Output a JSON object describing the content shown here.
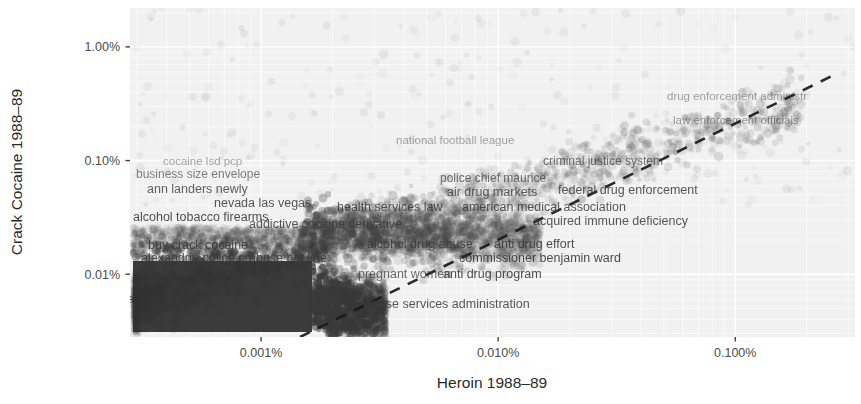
{
  "figure": {
    "background": "#ffffff",
    "panel_background": "#f1f1f1",
    "grid_color": "#fbfbfb",
    "point_color": "#4d4d4d",
    "label_color": "#3a3a3a",
    "refline_color": "#1a1a1a"
  },
  "chart_data": {
    "type": "scatter",
    "title": "",
    "xlabel": "Heroin 1988–89",
    "ylabel": "Crack Cocaine 1988–89",
    "xscale": "log",
    "yscale": "log",
    "xticks": [
      "0.001%",
      "0.010%",
      "0.100%"
    ],
    "xtick_values": [
      0.001,
      0.01,
      0.1
    ],
    "yticks": [
      "1.00%",
      "0.10%",
      "0.01%"
    ],
    "ytick_values": [
      1.0,
      0.1,
      0.01
    ],
    "xlim": [
      0.00028,
      0.32
    ],
    "ylim": [
      0.0028,
      2.2
    ],
    "grid": true,
    "legend": "none",
    "annotations": {
      "reference_line": {
        "style": "dashed",
        "description": "y = x diagonal reference line"
      }
    },
    "labeled_points": [
      {
        "text": "drug enforcement administr",
        "x": 0.055,
        "y": 0.32,
        "px": 667,
        "py": 100,
        "size": 11.5,
        "opacity": 0.45
      },
      {
        "text": "law enforcement officials",
        "x": 0.05,
        "y": 0.26,
        "px": 673,
        "py": 124,
        "size": 11.5,
        "opacity": 0.5
      },
      {
        "text": "national football league",
        "x": 0.0055,
        "y": 0.135,
        "px": 396,
        "py": 144,
        "size": 11.5,
        "opacity": 0.45
      },
      {
        "text": "criminal justice system",
        "x": 0.018,
        "y": 0.105,
        "px": 543,
        "py": 165,
        "size": 12,
        "opacity": 0.7
      },
      {
        "text": "cocaine lsd pcp",
        "x": 0.00072,
        "y": 0.075,
        "px": 163,
        "py": 165,
        "size": 11.5,
        "opacity": 0.45
      },
      {
        "text": "business size envelope",
        "x": 0.00062,
        "y": 0.062,
        "px": 136,
        "py": 178,
        "size": 12,
        "opacity": 0.65
      },
      {
        "text": "police chief maurice",
        "x": 0.0062,
        "y": 0.055,
        "px": 440,
        "py": 182,
        "size": 12,
        "opacity": 0.7
      },
      {
        "text": "federal drug enforcement",
        "x": 0.02,
        "y": 0.048,
        "px": 558,
        "py": 194,
        "size": 12.5,
        "opacity": 0.85
      },
      {
        "text": "ann landers newly",
        "x": 0.00068,
        "y": 0.048,
        "px": 147,
        "py": 193,
        "size": 12.5,
        "opacity": 0.8
      },
      {
        "text": "air drug markets",
        "x": 0.0068,
        "y": 0.046,
        "px": 447,
        "py": 196,
        "size": 12.5,
        "opacity": 0.8
      },
      {
        "text": "nevada las vegas",
        "x": 0.0012,
        "y": 0.038,
        "px": 214,
        "py": 207,
        "size": 12.5,
        "opacity": 0.85
      },
      {
        "text": "health services law",
        "x": 0.003,
        "y": 0.036,
        "px": 337,
        "py": 211,
        "size": 12.5,
        "opacity": 0.85
      },
      {
        "text": "american medical association",
        "x": 0.0105,
        "y": 0.035,
        "px": 462,
        "py": 211,
        "size": 12.5,
        "opacity": 0.85
      },
      {
        "text": "alcohol tobacco firearms",
        "x": 0.00058,
        "y": 0.03,
        "px": 133,
        "py": 221,
        "size": 12.5,
        "opacity": 0.9
      },
      {
        "text": "acquired immune deficiency",
        "x": 0.015,
        "y": 0.028,
        "px": 533,
        "py": 225,
        "size": 12.5,
        "opacity": 0.85
      },
      {
        "text": "addictive cocaine derivative",
        "x": 0.0017,
        "y": 0.024,
        "px": 249,
        "py": 228,
        "size": 12.5,
        "opacity": 0.85
      },
      {
        "text": "buy crack cocaine",
        "x": 0.0007,
        "y": 0.016,
        "px": 148,
        "py": 249,
        "size": 12.5,
        "opacity": 0.9
      },
      {
        "text": "alcohol drug abuse",
        "x": 0.004,
        "y": 0.015,
        "px": 367,
        "py": 248,
        "size": 12.5,
        "opacity": 0.85
      },
      {
        "text": "anti drug effort",
        "x": 0.0105,
        "y": 0.015,
        "px": 494,
        "py": 248,
        "size": 12.5,
        "opacity": 0.9
      },
      {
        "text": "alexandria police col",
        "x": 0.00062,
        "y": 0.0125,
        "px": 141,
        "py": 262,
        "size": 12.5,
        "opacity": 0.85
      },
      {
        "text": "abuse hot line",
        "x": 0.0014,
        "y": 0.0125,
        "px": 249,
        "py": 262,
        "size": 12.5,
        "opacity": 0.85
      },
      {
        "text": "commissioner benjamin ward",
        "x": 0.0098,
        "y": 0.012,
        "px": 459,
        "py": 262,
        "size": 12.5,
        "opacity": 0.9
      },
      {
        "text": "pregnant women",
        "x": 0.0048,
        "y": 0.0102,
        "px": 358,
        "py": 278,
        "size": 12.5,
        "opacity": 0.75
      },
      {
        "text": "anti drug program",
        "x": 0.009,
        "y": 0.0102,
        "px": 443,
        "py": 278,
        "size": 12.5,
        "opacity": 0.9
      },
      {
        "text": "abuse services administration",
        "x": 0.004,
        "y": 0.007,
        "px": 365,
        "py": 308,
        "size": 12.5,
        "opacity": 0.85
      },
      {
        "text": "aba",
        "x": 0.00032,
        "y": 0.0072,
        "px": 113,
        "py": 303,
        "size": 12.5,
        "opacity": 0.85
      }
    ]
  },
  "panel": {
    "left": 130,
    "top": 8,
    "right": 855,
    "bottom": 337
  }
}
